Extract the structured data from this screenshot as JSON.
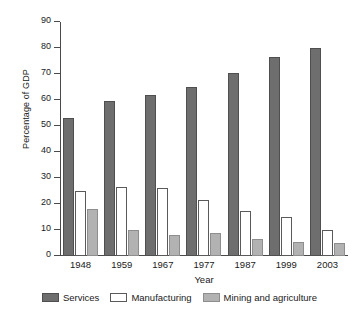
{
  "chart_data": {
    "type": "bar",
    "title": "",
    "subtitle": "",
    "xlabel": "Year",
    "ylabel": "Percentage of GDP",
    "categories": [
      "1948",
      "1959",
      "1967",
      "1977",
      "1987",
      "1999",
      "2003"
    ],
    "series": [
      {
        "name": "Services",
        "color": "#6e6e6e",
        "values": [
          53,
          59.5,
          62,
          65,
          70.5,
          76.5,
          80
        ]
      },
      {
        "name": "Manufacturing",
        "color": "#ffffff",
        "values": [
          25,
          26.5,
          26,
          21.5,
          17.5,
          15,
          10
        ]
      },
      {
        "name": "Mining and agriculture",
        "color": "#b2b2b2",
        "values": [
          18,
          10,
          8,
          9,
          6.5,
          5.5,
          5
        ]
      }
    ],
    "ylim": [
      0,
      90
    ],
    "yticks": [
      0,
      10,
      20,
      30,
      40,
      50,
      60,
      70,
      80,
      90
    ],
    "ytick_labels": [
      "0",
      "10",
      "20",
      "30",
      "40",
      "50",
      "60",
      "70",
      "80",
      "90"
    ],
    "grid": false,
    "legend_position": "bottom",
    "legend": [
      "Services",
      "Manufacturing",
      "Mining and agriculture"
    ]
  }
}
